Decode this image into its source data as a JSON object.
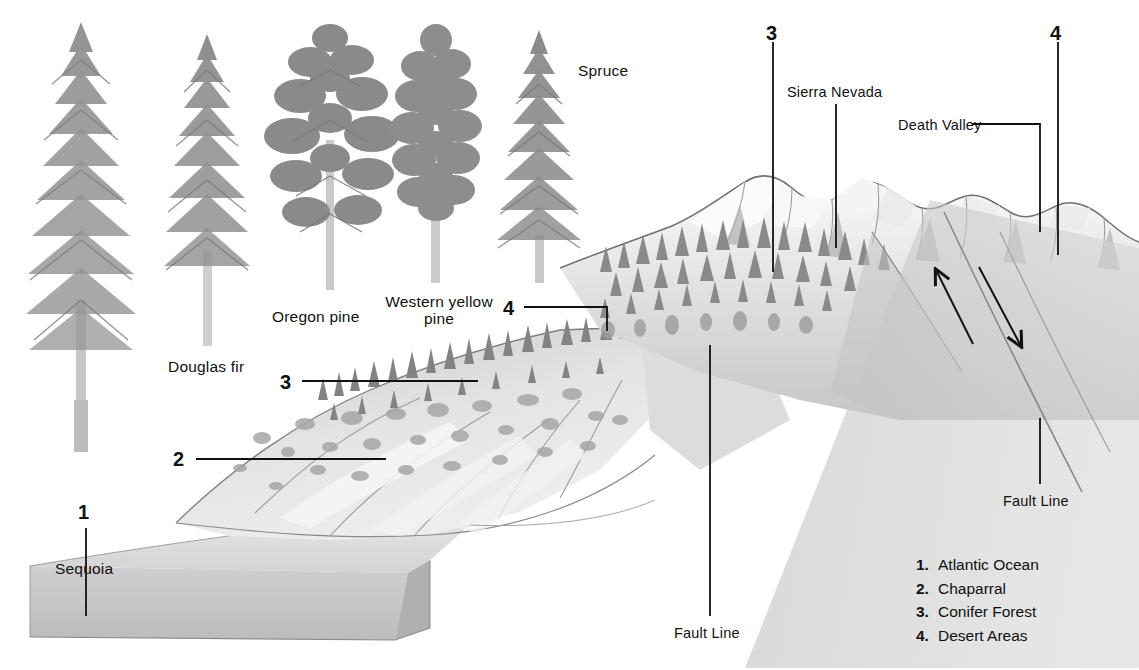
{
  "diagram": {
    "background_color": "#ffffff",
    "ink_color": "#111111",
    "terrain_palette": {
      "light": "#efefef",
      "mid": "#d4d4d4",
      "shadow": "#b4b4b4",
      "deep_shadow": "#9a9a9a",
      "outline": "#6e6e6e",
      "forest": "#8e8e8e",
      "forest_dark": "#6f6f6f",
      "ocean_block_top": "#d9d9d9",
      "ocean_block_face": "#c2c2c2"
    }
  },
  "tree_specimens": [
    {
      "id": "sequoia",
      "label": "Sequoia",
      "label_x": 55,
      "label_y": 560
    },
    {
      "id": "douglas-fir",
      "label": "Douglas fir",
      "label_x": 168,
      "label_y": 358
    },
    {
      "id": "oregon-pine",
      "label": "Oregon pine",
      "label_x": 272,
      "label_y": 308
    },
    {
      "id": "western-yellow-pine",
      "label": "Western yellow pine",
      "label_x": 381,
      "label_y": 293
    },
    {
      "id": "spruce",
      "label": "Spruce",
      "label_x": 578,
      "label_y": 62
    }
  ],
  "place_labels": [
    {
      "id": "sierra-nevada",
      "label": "Sierra Nevada",
      "x": 787,
      "y": 84
    },
    {
      "id": "death-valley",
      "label": "Death Valley",
      "x": 898,
      "y": 117
    },
    {
      "id": "fault-line-right",
      "label": "Fault Line",
      "x": 1003,
      "y": 493
    },
    {
      "id": "fault-line-bottom",
      "label": "Fault Line",
      "x": 674,
      "y": 625
    }
  ],
  "callout_numbers": [
    {
      "id": "callout-1",
      "label": "1",
      "x": 78,
      "y": 501
    },
    {
      "id": "callout-2",
      "label": "2",
      "x": 173,
      "y": 448
    },
    {
      "id": "callout-3-lower",
      "label": "3",
      "x": 280,
      "y": 371
    },
    {
      "id": "callout-4-mid",
      "label": "4",
      "x": 503,
      "y": 297
    },
    {
      "id": "callout-3-upper",
      "label": "3",
      "x": 766,
      "y": 22
    },
    {
      "id": "callout-4-upper",
      "label": "4",
      "x": 1050,
      "y": 22
    }
  ],
  "legend": {
    "items": [
      {
        "num": "1.",
        "label": "Atlantic Ocean"
      },
      {
        "num": "2.",
        "label": "Chaparral"
      },
      {
        "num": "3.",
        "label": "Conifer Forest"
      },
      {
        "num": "4.",
        "label": "Desert Areas"
      }
    ]
  },
  "fault_arrows": [
    {
      "id": "arrow-up-left",
      "direction": "up-left",
      "from_x": 973,
      "from_y": 344,
      "to_x": 936,
      "to_y": 270
    },
    {
      "id": "arrow-down-right",
      "direction": "down-right",
      "from_x": 979,
      "from_y": 267,
      "to_x": 1021,
      "to_y": 346
    }
  ]
}
